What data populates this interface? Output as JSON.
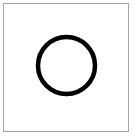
{
  "canvas": {
    "width": 136,
    "height": 136,
    "background": "#ffffff"
  },
  "frame": {
    "border_color": "#a3a3a3"
  },
  "shape": {
    "type": "circle-outline",
    "icon": "circle-icon",
    "stroke_color": "#000000",
    "fill": "none",
    "cx": 66.5,
    "cy": 65.5,
    "r": 28.5,
    "stroke_width": 4.5
  }
}
